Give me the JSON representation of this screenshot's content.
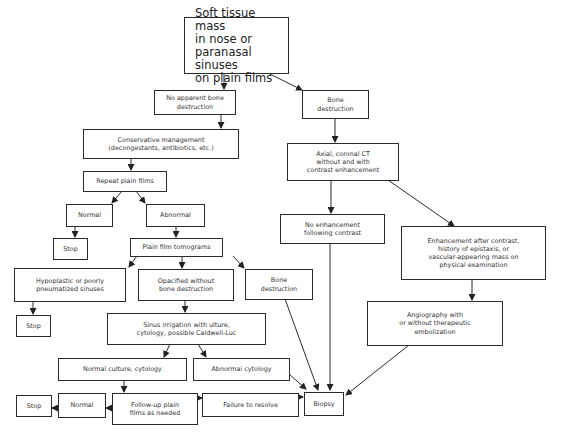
{
  "diagram": {
    "type": "flowchart",
    "nodes": {
      "start": "Soft tissue mass\n  in nose or\n  paranasal sinuses\n  on plain films",
      "no_bone_destruction": "No apparent bone\ndestruction",
      "bone_destruction_right": "Bone\ndestruction",
      "conservative": "Conservative management\n(decongestants, antibiotics, etc.)",
      "ct": "Axial, coronal CT\nwithout and with\ncontrast enhancement",
      "repeat_films": "Repeat plain films",
      "normal_1": "Normal",
      "abnormal": "Abnormal",
      "stop_1": "Stop",
      "tomograms": "Plain film tomograms",
      "no_enhancement": "No enhancement\nfollowing contrast",
      "enhancement": "Enhancement after contrast,\nhistory of epistaxis, or\nvascular-appearing mass on\nphysical examination",
      "hypoplastic": "Hypoplastic or poorly\npneumatized sinuses",
      "opacified": "Opacified without\nbone destruction",
      "bone_destruction_mid": "Bone\ndestruction",
      "stop_2": "Stop",
      "irrigation": "Sinus irrigation with  ulture,\ncytology, possible Caldwell-Luc",
      "angiography": "Angiography with\nor without therapeutic\nembolization",
      "normal_culture": "Normal culture, cytology",
      "abnormal_cytology": "Abnormai cytology",
      "stop_3": "Stop",
      "normal_2": "Normal",
      "follow_up": "Follow-up plain\nfilms as needed",
      "failure": "Failure to resolve",
      "biopsy": "Biopsy"
    },
    "edges": [
      [
        "start",
        "no_bone_destruction"
      ],
      [
        "start",
        "bone_destruction_right"
      ],
      [
        "no_bone_destruction",
        "conservative"
      ],
      [
        "conservative",
        "repeat_films"
      ],
      [
        "repeat_films",
        "normal_1"
      ],
      [
        "repeat_films",
        "abnormal"
      ],
      [
        "normal_1",
        "stop_1"
      ],
      [
        "abnormal",
        "tomograms"
      ],
      [
        "tomograms",
        "hypoplastic"
      ],
      [
        "tomograms",
        "opacified"
      ],
      [
        "tomograms",
        "bone_destruction_mid"
      ],
      [
        "hypoplastic",
        "stop_2"
      ],
      [
        "opacified",
        "irrigation"
      ],
      [
        "irrigation",
        "normal_culture"
      ],
      [
        "irrigation",
        "abnormal_cytology"
      ],
      [
        "normal_culture",
        "follow_up"
      ],
      [
        "follow_up",
        "normal_2"
      ],
      [
        "normal_2",
        "stop_3"
      ],
      [
        "follow_up",
        "failure"
      ],
      [
        "failure",
        "biopsy"
      ],
      [
        "abnormal_cytology",
        "biopsy"
      ],
      [
        "bone_destruction_mid",
        "biopsy"
      ],
      [
        "bone_destruction_right",
        "ct"
      ],
      [
        "ct",
        "no_enhancement"
      ],
      [
        "ct",
        "enhancement"
      ],
      [
        "no_enhancement",
        "biopsy"
      ],
      [
        "enhancement",
        "angiography"
      ],
      [
        "angiography",
        "biopsy"
      ]
    ],
    "colors": {
      "line": "#2b2b2b",
      "text": "#333333",
      "background": "#ffffff"
    }
  }
}
